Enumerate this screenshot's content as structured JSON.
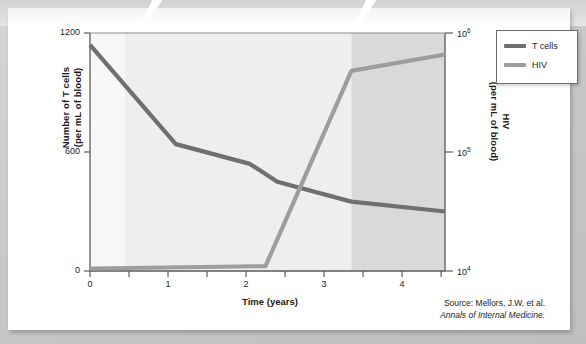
{
  "figure": {
    "source_line1": "Source: Mellors, J.W. et al.",
    "source_line2": "Annals of Internal Medicine."
  },
  "legend": {
    "items": [
      {
        "label": "T cells",
        "color": "#6f6f6f"
      },
      {
        "label": "HIV",
        "color": "#9d9d9d"
      }
    ]
  },
  "chart_data": {
    "type": "line",
    "title": "",
    "xlabel": "Time (years)",
    "ylabel": "Number of T cells (per mL of blood)",
    "y2label": "HIV (per mL of blood)",
    "xlim": [
      0,
      4.55
    ],
    "xticks": [
      0,
      0.5,
      1,
      1.5,
      2,
      2.5,
      3,
      3.5,
      4,
      4.5
    ],
    "xticklabels": [
      "0",
      "",
      "1",
      "",
      "2",
      "",
      "3",
      "",
      "4",
      ""
    ],
    "ylim": [
      0,
      1200
    ],
    "yticks": [
      0,
      600,
      1200
    ],
    "yticklabels": [
      "0",
      "600",
      "1200"
    ],
    "y2_scale": "log",
    "y2lim": [
      10000,
      1000000
    ],
    "y2ticks": [
      10000,
      100000,
      1000000
    ],
    "y2ticklabels": [
      "10⁴",
      "10⁵",
      "10⁶"
    ],
    "grid": false,
    "legend_position": "upper right",
    "bands": [
      {
        "name": "acute",
        "x0": 0.0,
        "x1": 0.45,
        "color": "#f7f7f7"
      },
      {
        "name": "latency",
        "x0": 0.45,
        "x1": 3.35,
        "color": "#eeeeee"
      },
      {
        "name": "aids",
        "x0": 3.35,
        "x1": 4.55,
        "color": "#d9d9d9"
      }
    ],
    "series": [
      {
        "name": "T cells",
        "axis": "left",
        "color": "#6f6f6f",
        "x": [
          0.0,
          1.1,
          2.05,
          2.4,
          3.35,
          4.55
        ],
        "values": [
          1140,
          640,
          540,
          450,
          350,
          300
        ]
      },
      {
        "name": "HIV",
        "axis": "right",
        "color": "#9d9d9d",
        "x": [
          0.0,
          2.25,
          3.35,
          4.55
        ],
        "values": [
          10500,
          11000,
          480000,
          660000
        ]
      }
    ]
  }
}
